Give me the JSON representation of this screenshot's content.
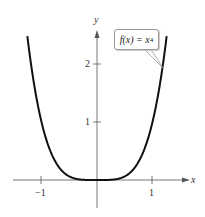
{
  "chart_data": {
    "type": "line",
    "title": "",
    "function_label": "f(x) = x^4",
    "xlabel": "x",
    "ylabel": "y",
    "xlim": [
      -1.5,
      1.35
    ],
    "ylim": [
      -0.5,
      2.6
    ],
    "x_ticks": [
      -1,
      1
    ],
    "x_tick_labels": [
      "−1",
      "1"
    ],
    "y_ticks": [
      1,
      2
    ],
    "y_tick_labels": [
      "1",
      "2"
    ],
    "grid": false,
    "legend": "callout near upper-right of curve",
    "series": [
      {
        "name": "f(x) = x^4",
        "x": [
          -1.26,
          -1.2,
          -1.1,
          -1.0,
          -0.9,
          -0.8,
          -0.7,
          -0.6,
          -0.5,
          -0.4,
          -0.3,
          -0.2,
          -0.1,
          0,
          0.1,
          0.2,
          0.3,
          0.4,
          0.5,
          0.6,
          0.7,
          0.8,
          0.9,
          1.0,
          1.1,
          1.2,
          1.26
        ],
        "y": [
          2.52,
          2.07,
          1.46,
          1.0,
          0.66,
          0.41,
          0.24,
          0.13,
          0.06,
          0.03,
          0.01,
          0.0,
          0.0,
          0,
          0.0,
          0.0,
          0.01,
          0.03,
          0.06,
          0.13,
          0.24,
          0.41,
          0.66,
          1.0,
          1.46,
          2.07,
          2.52
        ]
      }
    ]
  },
  "labels": {
    "x_axis": "x",
    "y_axis": "y",
    "x_tick_neg1": "−1",
    "x_tick_1": "1",
    "y_tick_1": "1",
    "y_tick_2": "2",
    "callout_main": "f(x) = x",
    "callout_exp": "4"
  }
}
